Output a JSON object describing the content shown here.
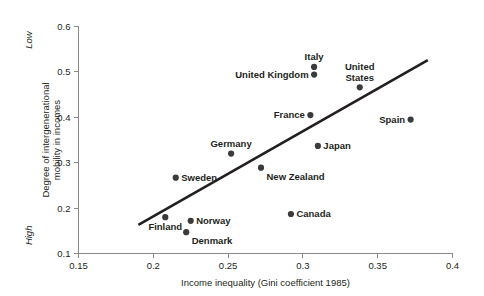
{
  "chart_data": {
    "type": "scatter",
    "title": "",
    "xlabel": "Income inequality (Gini coefficient 1985)",
    "ylabel": "Degree of intergenerational\nmobility in incomes",
    "ylabel_line1": "Degree of intergenerational",
    "ylabel_line2": "mobility in incomes",
    "xlim": [
      0.15,
      0.4
    ],
    "ylim": [
      0.1,
      0.6
    ],
    "xticks": [
      0.15,
      0.2,
      0.25,
      0.3,
      0.35,
      0.4
    ],
    "xtick_labels": [
      "0.15",
      "0.2",
      "0.25",
      "0.3",
      "0.35",
      "0.4"
    ],
    "yticks": [
      0.1,
      0.2,
      0.3,
      0.4,
      0.5,
      0.6
    ],
    "ytick_labels": [
      "0.1",
      "0.2",
      "0.3",
      "0.4",
      "0.5",
      "0.6"
    ],
    "grid": false,
    "legend": "none",
    "y_axis_annotations": [
      {
        "text": "Low",
        "value": 0.57,
        "name": "low-annotation"
      },
      {
        "text": "High",
        "value": 0.14,
        "name": "high-annotation"
      }
    ],
    "points": [
      {
        "label": "Sweden",
        "x": 0.215,
        "y": 0.267,
        "label_pos": "right"
      },
      {
        "label": "Finland",
        "x": 0.208,
        "y": 0.18,
        "label_pos": "below"
      },
      {
        "label": "Norway",
        "x": 0.225,
        "y": 0.172,
        "label_pos": "right"
      },
      {
        "label": "Denmark",
        "x": 0.222,
        "y": 0.147,
        "label_pos": "below-right"
      },
      {
        "label": "Germany",
        "x": 0.252,
        "y": 0.32,
        "label_pos": "above"
      },
      {
        "label": "New Zealand",
        "x": 0.272,
        "y": 0.289,
        "label_pos": "below-right"
      },
      {
        "label": "Canada",
        "x": 0.292,
        "y": 0.187,
        "label_pos": "right"
      },
      {
        "label": "France",
        "x": 0.305,
        "y": 0.405,
        "label_pos": "left"
      },
      {
        "label": "Japan",
        "x": 0.31,
        "y": 0.337,
        "label_pos": "right"
      },
      {
        "label": "United Kingdom",
        "x": 0.3075,
        "y": 0.494,
        "label_pos": "left"
      },
      {
        "label": "Italy",
        "x": 0.3075,
        "y": 0.511,
        "label_pos": "above"
      },
      {
        "label": "United States",
        "x": 0.338,
        "y": 0.466,
        "label_pos": "above"
      },
      {
        "label": "Spain",
        "x": 0.372,
        "y": 0.395,
        "label_pos": "left"
      }
    ],
    "trend_line": {
      "name": "regression-line",
      "x0": 0.19,
      "y0": 0.163,
      "x1": 0.3835,
      "y1": 0.526
    },
    "colors": {
      "point": "#3b3b3b",
      "line": "#231f20",
      "axis": "#8a8a8a",
      "text": "#231f20",
      "background": "#ffffff"
    }
  }
}
